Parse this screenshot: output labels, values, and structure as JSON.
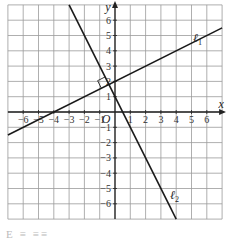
{
  "chart_data": {
    "type": "line",
    "title": "",
    "xlabel": "x",
    "ylabel": "y",
    "origin_label": "O",
    "xlim": [
      -7,
      7
    ],
    "ylim": [
      -7,
      7
    ],
    "grid": true,
    "x_ticks": [
      -6,
      -5,
      -4,
      -3,
      -2,
      -1,
      1,
      2,
      3,
      4,
      5,
      6
    ],
    "y_ticks": [
      -6,
      -5,
      -4,
      -3,
      -2,
      -1,
      1,
      2,
      3,
      4,
      5,
      6
    ],
    "series": [
      {
        "name": "ℓ1",
        "label_main": "ℓ",
        "label_sub": "1",
        "equation": "y = 0.5x + 2",
        "slope": 0.5,
        "intercept": 2,
        "x": [
          -7,
          7
        ],
        "y": [
          -1.5,
          5.5
        ]
      },
      {
        "name": "ℓ2",
        "label_main": "ℓ",
        "label_sub": "2",
        "equation": "y = -2x + 1",
        "slope": -2,
        "intercept": 1,
        "x": [
          -3,
          4
        ],
        "y": [
          7,
          -7
        ]
      }
    ],
    "annotations": [
      {
        "type": "right-angle-marker",
        "at": [
          -0.4,
          1.8
        ],
        "text": "perpendicular"
      }
    ]
  },
  "caption": "E  ≡ ≡≡"
}
